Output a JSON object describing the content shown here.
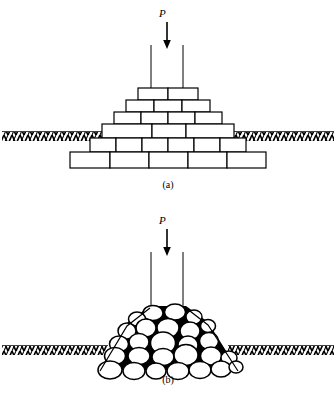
{
  "figure": {
    "type": "engineering-diagram",
    "panels": [
      {
        "key": "a",
        "caption": "(a)",
        "load_label": "P",
        "description": "stepped masonry brick pyramid foundation under vertical load",
        "structure": "brick-pyramid",
        "ground_line": true,
        "courses": [
          {
            "index": 0,
            "y": 88,
            "x": 138,
            "width": 60,
            "height": 12,
            "bricks": 2
          },
          {
            "index": 1,
            "y": 100,
            "x": 126,
            "width": 84,
            "height": 12,
            "bricks": 3
          },
          {
            "index": 2,
            "y": 112,
            "x": 114,
            "width": 108,
            "height": 12,
            "bricks": 4
          },
          {
            "index": 3,
            "y": 124,
            "x": 102,
            "width": 132,
            "height": 14,
            "bricks": 3
          },
          {
            "index": 4,
            "y": 138,
            "x": 90,
            "width": 156,
            "height": 14,
            "bricks": 6
          },
          {
            "index": 5,
            "y": 152,
            "x": 70,
            "width": 196,
            "height": 16,
            "bricks": 5
          }
        ]
      },
      {
        "key": "b",
        "caption": "(b)",
        "load_label": "P",
        "description": "pile of rounded granular particles under vertical load",
        "structure": "granular-pile",
        "ground_line": true,
        "particle_count": 34
      }
    ]
  },
  "colors": {
    "line": "#000000",
    "fill_brick": "#ffffff",
    "fill_particle": "#ffffff",
    "void": "#000000",
    "background": "#ffffff"
  },
  "annotations": {
    "arrow_a": {
      "name": "load-arrow",
      "x": 167,
      "y_from": 22,
      "y_to": 48
    },
    "arrow_b": {
      "name": "load-arrow",
      "x": 167,
      "y_from": 31,
      "y_to": 57
    },
    "column_lines_a": {
      "left_x": 151,
      "right_x": 183,
      "y_top": 45,
      "y_bottom": 88
    },
    "column_lines_b": {
      "left_x": 151,
      "right_x": 183,
      "y_top": 54,
      "y_bottom": 110
    }
  }
}
